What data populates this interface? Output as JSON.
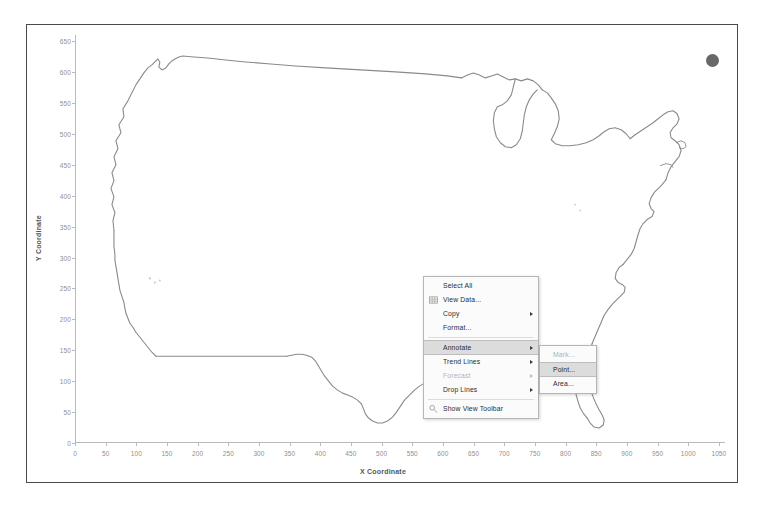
{
  "chart_data": {
    "type": "scatter",
    "title": "",
    "xlabel": "X Coordinate",
    "ylabel": "Y Coordinate",
    "xlim": [
      0,
      1060
    ],
    "ylim": [
      0,
      660
    ],
    "grid": false,
    "legend": "none",
    "x_ticks": [
      0,
      50,
      100,
      150,
      200,
      250,
      300,
      350,
      400,
      450,
      500,
      550,
      600,
      650,
      700,
      750,
      800,
      850,
      900,
      950,
      1000,
      1050
    ],
    "y_ticks": [
      0,
      50,
      100,
      150,
      200,
      250,
      300,
      350,
      400,
      450,
      500,
      550,
      600,
      650
    ],
    "x_tick_labels": [
      "0",
      "50",
      "100",
      "150",
      "200",
      "250",
      "300",
      "350",
      "400",
      "450",
      "500",
      "550",
      "600",
      "650",
      "700",
      "750",
      "800",
      "850",
      "900",
      "950",
      "1000",
      "1050"
    ],
    "y_tick_labels": [
      "0",
      "50",
      "100",
      "150",
      "200",
      "250",
      "300",
      "350",
      "400",
      "450",
      "500",
      "550",
      "600",
      "650"
    ],
    "series": [
      {
        "name": "Outlier mark",
        "color": "#4d4d4d",
        "points": [
          {
            "x": 1300,
            "y": 620
          }
        ]
      },
      {
        "name": "US map outline (dense point cloud forming coastline)",
        "color": "#8a8a8a",
        "points": []
      }
    ],
    "annotations": []
  },
  "chart": {
    "x_axis_title": "X Coordinate",
    "y_axis_title": "Y Coordinate"
  },
  "context_menu": {
    "items": [
      {
        "label": "Select All",
        "icon": "",
        "submenu": false,
        "disabled": false,
        "highlighted": false,
        "separator_after": false
      },
      {
        "label": "View Data...",
        "icon": "table-icon",
        "submenu": false,
        "disabled": false,
        "highlighted": false,
        "separator_after": false
      },
      {
        "label": "Copy",
        "icon": "",
        "submenu": true,
        "disabled": false,
        "highlighted": false,
        "separator_after": false
      },
      {
        "label": "Format...",
        "icon": "",
        "submenu": false,
        "disabled": false,
        "highlighted": false,
        "separator_after": true
      },
      {
        "label": "Annotate",
        "icon": "",
        "submenu": true,
        "disabled": false,
        "highlighted": true,
        "separator_after": false
      },
      {
        "label": "Trend Lines",
        "icon": "",
        "submenu": true,
        "disabled": false,
        "highlighted": false,
        "separator_after": false
      },
      {
        "label": "Forecast",
        "icon": "",
        "submenu": true,
        "disabled": true,
        "highlighted": false,
        "separator_after": false
      },
      {
        "label": "Drop Lines",
        "icon": "",
        "submenu": true,
        "disabled": false,
        "highlighted": false,
        "separator_after": true
      },
      {
        "label": "Show View Toolbar",
        "icon": "toolbar-icon",
        "submenu": false,
        "disabled": false,
        "highlighted": false,
        "separator_after": false
      }
    ]
  },
  "annotate_submenu": {
    "items": [
      {
        "label": "Mark...",
        "highlighted": false,
        "disabled": true
      },
      {
        "label": "Point...",
        "highlighted": true,
        "disabled": false
      },
      {
        "label": "Area...",
        "highlighted": false,
        "disabled": false
      }
    ]
  },
  "colors": {
    "frame_border": "#4a4a4a",
    "axis_line": "#b9b9b9",
    "tick_text": "#8f8f8f",
    "axis_title_text": "#555555",
    "map_stroke": "#8a8a8a",
    "mark_fill": "#4d4d4d",
    "menu_background": "#fbfbfb",
    "menu_border": "#b5b5b5",
    "menu_highlight": "#dcdcdc",
    "menu_text": "#2b2b2b",
    "menu_disabled_text": "#b3b3b3"
  }
}
